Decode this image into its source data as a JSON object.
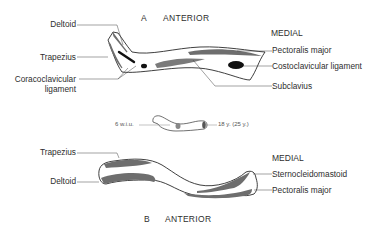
{
  "figure": {
    "panel_a": {
      "letter": "A",
      "view": "ANTERIOR",
      "medial_label": "MEDIAL",
      "left_labels": [
        "Deltoid",
        "Trapezius",
        "Coracoclavicular",
        "ligament"
      ],
      "right_labels": [
        "Pectoralis major",
        "Costoclavicular ligament",
        "Subclavius"
      ]
    },
    "middle": {
      "left_age": "6 w.i.u.",
      "right_age": "18 y. (25 y.)"
    },
    "panel_b": {
      "letter": "B",
      "view": "ANTERIOR",
      "medial_label": "MEDIAL",
      "left_labels": [
        "Trapezius",
        "Deltoid"
      ],
      "right_labels": [
        "Sternocleidomastoid",
        "Pectoralis major"
      ]
    },
    "colors": {
      "bone_outline": "#2a2a2a",
      "muscle_fill": "#6e6e6e",
      "ligament_fill": "#111111"
    }
  }
}
